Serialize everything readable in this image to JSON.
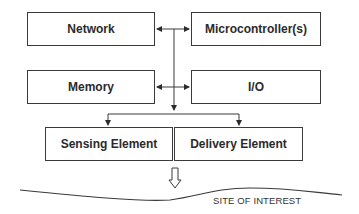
{
  "diagram": {
    "blocks": {
      "network": "Network",
      "microcontroller": "Microcontroller(s)",
      "memory": "Memory",
      "io": "I/O",
      "sensing": "Sensing Element",
      "delivery": "Delivery Element"
    },
    "site_label": "SITE OF INTEREST",
    "colors": {
      "line": "#3a3a3a",
      "text": "#2b2b2b",
      "background": "#ffffff"
    }
  }
}
